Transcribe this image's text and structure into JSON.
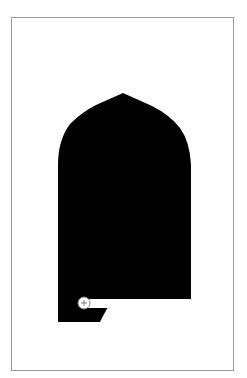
{
  "figure": {
    "colors": {
      "background": "#ffffff",
      "shape_fill": "#000000",
      "border": "#9a9a9a",
      "mark_stroke": "#888888"
    },
    "elements": [
      "arch-silhouette",
      "registration-mark"
    ]
  }
}
